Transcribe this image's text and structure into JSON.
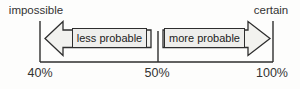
{
  "diagram": {
    "title_implied": "probability scale",
    "top_labels": {
      "left": "impossible",
      "right": "certain"
    },
    "arrows": {
      "left": {
        "label": "less probable",
        "direction": "left"
      },
      "right": {
        "label": "more probable",
        "direction": "right"
      }
    },
    "axis": {
      "orientation": "horizontal",
      "ticks": [
        {
          "label": "40%",
          "position": "left"
        },
        {
          "label": "50%",
          "position": "middle"
        },
        {
          "label": "100%",
          "position": "right"
        }
      ]
    },
    "colors": {
      "background": "#fdfdfc",
      "line": "#2e2e2e",
      "arrow_fill": "#f2f2ef",
      "label_box_fill": "#eeeeec",
      "text": "#333333"
    }
  }
}
